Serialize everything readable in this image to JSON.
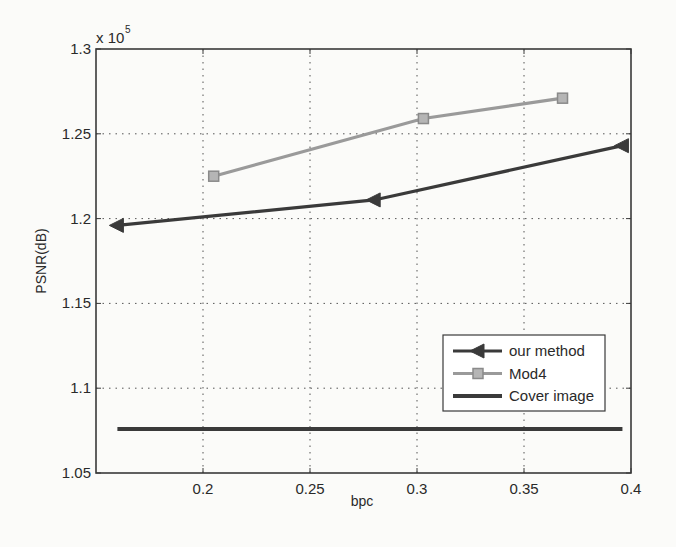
{
  "chart_data": {
    "type": "line",
    "title": "",
    "xlabel": "bpc",
    "ylabel": "PSNR(dB)",
    "y_multiplier_label": "x 10",
    "y_multiplier_exponent": "5",
    "xlim": [
      0.15,
      0.4
    ],
    "ylim": [
      1.05,
      1.3
    ],
    "y_scale": 100000,
    "grid": true,
    "legend_position": "inside lower right",
    "xticks": [
      0.2,
      0.25,
      0.3,
      0.35,
      0.4
    ],
    "xtick_labels": [
      "0.2",
      "0.25",
      "0.3",
      "0.35",
      "0.4"
    ],
    "yticks": [
      1.05,
      1.1,
      1.15,
      1.2,
      1.25,
      1.3
    ],
    "ytick_labels": [
      "1.05",
      "1.1",
      "1.15",
      "1.2",
      "1.25",
      "1.3"
    ],
    "series": [
      {
        "name": "our method",
        "marker": "triangle-left",
        "color": "#3a3a3a",
        "x": [
          0.16,
          0.28,
          0.396
        ],
        "y": [
          1.196,
          1.211,
          1.243
        ]
      },
      {
        "name": "Mod4",
        "marker": "square",
        "color": "#9a9a9a",
        "x": [
          0.205,
          0.303,
          0.368
        ],
        "y": [
          1.225,
          1.259,
          1.271
        ]
      },
      {
        "name": "Cover image",
        "marker": "none",
        "color": "#3a3a3a",
        "x": [
          0.16,
          0.396
        ],
        "y": [
          1.076,
          1.076
        ]
      }
    ]
  }
}
